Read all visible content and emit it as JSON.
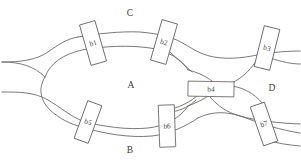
{
  "figure": {
    "background_color": "#ffffff",
    "line_color": "#6d6a68",
    "box_fill": "#ffffff",
    "box_stroke": "#5d5a58",
    "text_color": "#3d3b39",
    "width": 301,
    "height": 166
  },
  "regions": [
    {
      "id": "region-c",
      "label": "C",
      "x": 130,
      "y": 13
    },
    {
      "id": "region-a",
      "label": "A",
      "x": 131,
      "y": 85
    },
    {
      "id": "region-d",
      "label": "D",
      "x": 272,
      "y": 88
    },
    {
      "id": "region-b",
      "label": "B",
      "x": 130,
      "y": 150
    }
  ],
  "bridges": [
    {
      "id": "b1",
      "label": "b1",
      "cx": 93,
      "cy": 43,
      "w": 16,
      "h": 42,
      "rotate": -16
    },
    {
      "id": "b2",
      "label": "b2",
      "cx": 164,
      "cy": 42,
      "w": 16,
      "h": 42,
      "rotate": 16
    },
    {
      "id": "b3",
      "label": "b3",
      "cx": 267,
      "cy": 48,
      "w": 16,
      "h": 42,
      "rotate": 14
    },
    {
      "id": "b4",
      "label": "b4",
      "cx": 211,
      "cy": 89,
      "w": 46,
      "h": 15,
      "rotate": 1
    },
    {
      "id": "b5",
      "label": "b5",
      "cx": 88,
      "cy": 122,
      "w": 15,
      "h": 40,
      "rotate": 20
    },
    {
      "id": "b6",
      "label": "b6",
      "cx": 167,
      "cy": 126,
      "w": 16,
      "h": 42,
      "rotate": -2
    },
    {
      "id": "b7",
      "label": "b7",
      "cx": 264,
      "cy": 124,
      "w": 15,
      "h": 41,
      "rotate": -19
    }
  ],
  "edges": [
    {
      "id": "inlet-upper-left",
      "d": "M 2 62 C 22 62 36 60 48 52 C 58 45 66 39 78 37"
    },
    {
      "id": "outer-top-arc-left",
      "d": "M 78 37 C 96 34 120 31 140 32 C 152 33 163 35 172 38"
    },
    {
      "id": "outer-top-arc-right",
      "d": "M 172 38 C 188 44 196 54 214 57 C 232 60 248 57 262 54"
    },
    {
      "id": "upper-right-exit",
      "d": "M 262 54 C 276 52 288 51 300 51"
    },
    {
      "id": "inner-top-arc",
      "d": "M 45 77 C 50 63 64 54 82 50 C 104 46 130 45 150 48 C 168 51 182 59 188 70"
    },
    {
      "id": "junction-left-upper",
      "d": "M 2 62 C 20 62 34 66 45 77"
    },
    {
      "id": "inlet-lower-left",
      "d": "M 2 92 C 20 92 34 92 48 100 C 60 107 70 116 82 121"
    },
    {
      "id": "junction-left-lower",
      "d": "M 45 77 C 38 88 40 100 50 110 C 60 119 70 124 82 127"
    },
    {
      "id": "inner-bottom-arc",
      "d": "M 82 121 C 104 127 128 130 148 128 C 166 126 180 118 188 106"
    },
    {
      "id": "outer-bottom-arc",
      "d": "M 82 127 C 104 134 130 138 152 136 C 170 134 186 126 198 118"
    },
    {
      "id": "bottom-right-lower",
      "d": "M 198 118 C 214 110 230 112 246 118 C 262 124 280 130 300 133"
    },
    {
      "id": "bottom-right-upper",
      "d": "M 210 97 C 218 106 226 112 240 116 C 258 121 278 123 300 124"
    },
    {
      "id": "right-loop-upper",
      "d": "M 188 70 C 196 72 204 75 212 81"
    },
    {
      "id": "right-loop-lower",
      "d": "M 188 106 C 196 103 204 99 210 95"
    },
    {
      "id": "d-region-upper-branch",
      "d": "M 232 83 C 244 77 252 68 258 58"
    },
    {
      "id": "d-region-right-upper",
      "d": "M 270 58 C 282 62 292 64 300 64"
    },
    {
      "id": "right-node-to-b4-top",
      "d": "M 232 86 C 246 88 258 96 266 108"
    },
    {
      "id": "right-node-to-b7",
      "d": "M 266 140 C 276 143 288 145 300 146"
    },
    {
      "id": "b2-lower-branch",
      "d": "M 170 52 C 178 60 186 66 192 72"
    },
    {
      "id": "b6-upper-branch",
      "d": "M 172 112 C 182 110 190 106 196 100"
    },
    {
      "id": "b6-right-curve",
      "d": "M 175 108 C 188 104 198 96 206 88"
    }
  ]
}
